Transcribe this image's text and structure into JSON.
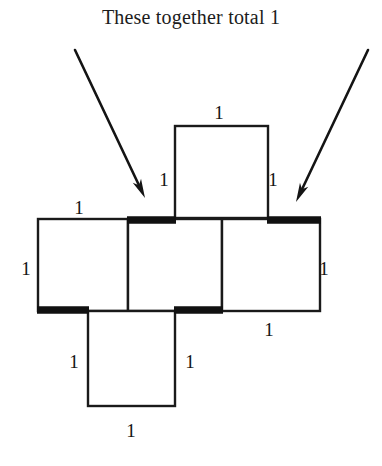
{
  "caption": {
    "text": "These together total 1"
  },
  "colors": {
    "ink": "#141414",
    "background": "#ffffff",
    "thick_edge": "#111111",
    "thin_edge": "#1a1a1a"
  },
  "figure": {
    "square_side_label": "1",
    "squares": [
      {
        "name": "top-square",
        "x": 175,
        "y": 126,
        "w": 93,
        "h": 92
      },
      {
        "name": "middle-left-square",
        "x": 38,
        "y": 219,
        "w": 90,
        "h": 92
      },
      {
        "name": "middle-center-square",
        "x": 128,
        "y": 219,
        "w": 94,
        "h": 92
      },
      {
        "name": "middle-right-square",
        "x": 222,
        "y": 219,
        "w": 98,
        "h": 92
      },
      {
        "name": "bottom-square",
        "x": 88,
        "y": 311,
        "w": 87,
        "h": 95
      }
    ],
    "thick_segments": [
      {
        "name": "thick-edge-center-top",
        "x1": 127,
        "y1": 220,
        "x2": 176,
        "y2": 220
      },
      {
        "name": "thick-edge-right-top",
        "x1": 267,
        "y1": 220,
        "x2": 321,
        "y2": 220
      },
      {
        "name": "thick-edge-left-bottom",
        "x1": 37,
        "y1": 310,
        "x2": 89,
        "y2": 310
      },
      {
        "name": "thick-edge-center-bottom",
        "x1": 174,
        "y1": 310,
        "x2": 223,
        "y2": 310
      }
    ],
    "arrows": [
      {
        "name": "left-arrow",
        "x1": 75,
        "y1": 50,
        "x2": 145,
        "y2": 198
      },
      {
        "name": "right-arrow",
        "x1": 368,
        "y1": 50,
        "x2": 296,
        "y2": 202
      }
    ],
    "labels": [
      {
        "name": "label-top-square-top",
        "value": "1",
        "x": 219,
        "y": 112
      },
      {
        "name": "label-top-square-left",
        "value": "1",
        "x": 164,
        "y": 179
      },
      {
        "name": "label-top-square-right",
        "value": "1",
        "x": 273,
        "y": 179
      },
      {
        "name": "label-middle-left-square-top",
        "value": "1",
        "x": 79,
        "y": 207
      },
      {
        "name": "label-middle-left-square-left",
        "value": "1",
        "x": 26,
        "y": 268
      },
      {
        "name": "label-middle-right-square-right",
        "value": "1",
        "x": 324,
        "y": 268
      },
      {
        "name": "label-middle-right-square-bottom",
        "value": "1",
        "x": 269,
        "y": 329
      },
      {
        "name": "label-bottom-square-left",
        "value": "1",
        "x": 74,
        "y": 361
      },
      {
        "name": "label-bottom-square-right",
        "value": "1",
        "x": 190,
        "y": 361
      },
      {
        "name": "label-bottom-square-bottom",
        "value": "1",
        "x": 131,
        "y": 430
      }
    ]
  }
}
